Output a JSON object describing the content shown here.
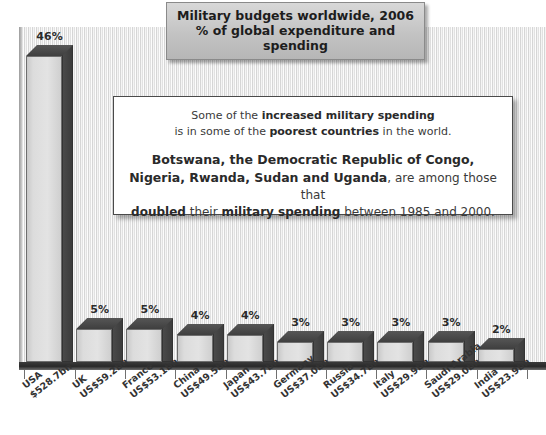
{
  "title": {
    "line1": "Military budgets worldwide, 2006",
    "line2": "% of global expenditure and spending"
  },
  "callout": {
    "para1_a": "Some of the ",
    "para1_b": "increased military spending",
    "para1_c": "is in some of the ",
    "para1_d": "poorest countries",
    "para1_e": " in the world.",
    "para2_a": "Botswana, the Democratic Republic of Congo,",
    "para2_b": "Nigeria, Rwanda, Sudan and Uganda",
    "para2_c": ", are among those that",
    "para2_d": "doubled",
    "para2_e": " their ",
    "para2_f": "military spending",
    "para2_g": " between 1985 and 2000."
  },
  "chart_data": {
    "type": "bar",
    "xlabel": "",
    "ylabel": "% of global expenditure",
    "ylim": [
      0,
      50
    ],
    "grid": false,
    "legend": "none",
    "categories": [
      "USA",
      "UK",
      "France",
      "China",
      "Japan",
      "Germany",
      "Russia",
      "Italy",
      "Saudi Arabia",
      "India"
    ],
    "values": [
      46,
      5,
      5,
      4,
      4,
      3,
      3,
      3,
      3,
      2
    ],
    "value_labels": [
      "46%",
      "5%",
      "5%",
      "4%",
      "4%",
      "3%",
      "3%",
      "3%",
      "3%",
      "2%"
    ],
    "amounts": [
      "$528.7bn",
      "US$59.2bn",
      "US$53.1bn",
      "US$49.5bn",
      "US$43.7bn",
      "US$37.0bn",
      "US$34.7bn",
      "US$29.9bn",
      "US$29.0bn",
      "US$23.9bn"
    ],
    "series": [
      {
        "name": "% of global military expenditure",
        "values": [
          46,
          5,
          5,
          4,
          4,
          3,
          3,
          3,
          3,
          2
        ]
      }
    ],
    "colors": {
      "bar_front": "#dcdcdc",
      "bar_side": "#3f3f3f",
      "background": "#ebebeb",
      "axis": "#2f2f2f",
      "text": "#2b2b2b"
    }
  }
}
